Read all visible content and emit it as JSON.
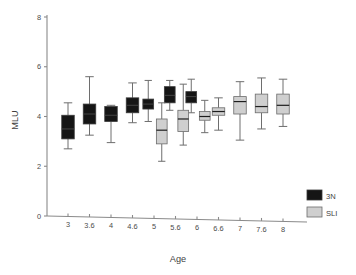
{
  "chart_data": {
    "type": "box",
    "title": "",
    "xlabel": "Age",
    "ylabel": "MLU",
    "ylim": [
      0,
      8
    ],
    "yticks": [
      0,
      2,
      4,
      6,
      8
    ],
    "ytick_labels": [
      "0",
      "2",
      "4",
      "6",
      "8"
    ],
    "grid": false,
    "legend_position": "right-bottom",
    "categories": [
      "3",
      "3.6",
      "4",
      "4.6",
      "5",
      "5.6",
      "6",
      "6.6",
      "7",
      "7.6",
      "8"
    ],
    "series": [
      {
        "name": "3N",
        "color": "#151515",
        "boxes": [
          {
            "category": "3",
            "whisker_low": 2.7,
            "q1": 3.1,
            "median": 3.5,
            "q3": 4.05,
            "whisker_high": 4.55
          },
          {
            "category": "3.6",
            "whisker_low": 3.25,
            "q1": 3.7,
            "median": 4.1,
            "q3": 4.5,
            "whisker_high": 5.6
          },
          {
            "category": "4",
            "whisker_low": 2.95,
            "q1": 3.8,
            "median": 4.05,
            "q3": 4.4,
            "whisker_high": 4.45
          },
          {
            "category": "4.6",
            "whisker_low": 3.75,
            "q1": 4.15,
            "median": 4.45,
            "q3": 4.75,
            "whisker_high": 5.35
          },
          {
            "category": "5",
            "whisker_low": 3.8,
            "q1": 4.3,
            "median": 4.5,
            "q3": 4.7,
            "whisker_high": 5.45
          },
          {
            "category": "5.6",
            "whisker_low": 4.25,
            "q1": 4.55,
            "median": 4.85,
            "q3": 5.2,
            "whisker_high": 5.45
          },
          {
            "category": "6",
            "whisker_low": 4.15,
            "q1": 4.55,
            "median": 4.8,
            "q3": 5.0,
            "whisker_high": 5.5
          }
        ]
      },
      {
        "name": "SLI",
        "color": "#cfcfcf",
        "boxes": [
          {
            "category": "5",
            "whisker_low": 2.2,
            "q1": 2.9,
            "median": 3.45,
            "q3": 3.9,
            "whisker_high": 4.55
          },
          {
            "category": "5.6",
            "whisker_low": 2.85,
            "q1": 3.4,
            "median": 3.9,
            "q3": 4.25,
            "whisker_high": 5.3
          },
          {
            "category": "6",
            "whisker_low": 3.35,
            "q1": 3.85,
            "median": 4.0,
            "q3": 4.2,
            "whisker_high": 4.65
          },
          {
            "category": "6.6",
            "whisker_low": 3.45,
            "q1": 4.05,
            "median": 4.2,
            "q3": 4.35,
            "whisker_high": 4.75
          },
          {
            "category": "7",
            "whisker_low": 3.05,
            "q1": 4.1,
            "median": 4.6,
            "q3": 4.8,
            "whisker_high": 5.4
          },
          {
            "category": "7.6",
            "whisker_low": 3.5,
            "q1": 4.15,
            "median": 4.4,
            "q3": 4.9,
            "whisker_high": 5.55
          },
          {
            "category": "8",
            "whisker_low": 3.6,
            "q1": 4.1,
            "median": 4.45,
            "q3": 4.9,
            "whisker_high": 5.5
          }
        ]
      }
    ],
    "legend": [
      {
        "label": "3N",
        "color": "#151515"
      },
      {
        "label": "SLI",
        "color": "#cfcfcf"
      }
    ]
  }
}
